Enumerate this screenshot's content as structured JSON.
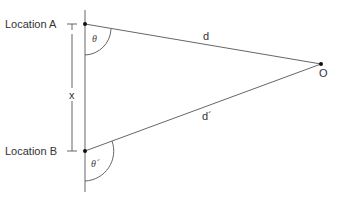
{
  "diagram": {
    "points": {
      "A": {
        "label": "Location A"
      },
      "B": {
        "label": "Location B"
      },
      "O": {
        "label": "O"
      }
    },
    "segments": {
      "AO": {
        "label": "d"
      },
      "BO": {
        "label": "d´"
      },
      "AB": {
        "label": "x"
      }
    },
    "angles": {
      "at_A": {
        "label": "θ"
      },
      "at_B": {
        "label": "θ´"
      }
    },
    "colors": {
      "line": "#555555",
      "point": "#111111",
      "text": "#333333"
    }
  }
}
